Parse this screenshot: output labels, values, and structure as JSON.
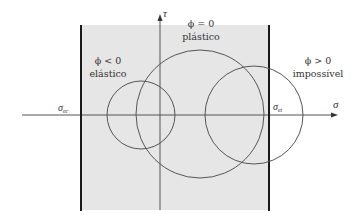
{
  "diagram": {
    "type": "mohr-circle-yield-regions",
    "colors": {
      "elastic_region_fill": "#e6e6e6",
      "line": "#555555",
      "boundary": "#1a1a1a",
      "text": "#333333"
    },
    "axes": {
      "x_label": "σ",
      "y_label": "τ"
    },
    "boundaries": {
      "left": {
        "symbol": "σ",
        "subscript": "ec"
      },
      "right": {
        "symbol": "σ",
        "subscript": "et"
      }
    },
    "regions": [
      {
        "id": "elastic",
        "condition": "ϕ < 0",
        "label": "elástico"
      },
      {
        "id": "plastic",
        "condition": "ϕ = 0",
        "label": "plástico"
      },
      {
        "id": "impossible",
        "condition": "ϕ > 0",
        "label": "impossível"
      }
    ],
    "circles": [
      {
        "id": "elastic-circle",
        "cx": 141,
        "cy": 115,
        "r": 34
      },
      {
        "id": "plastic-circle",
        "cx": 200,
        "cy": 114,
        "r": 64
      },
      {
        "id": "impossible-circle",
        "cx": 254,
        "cy": 115,
        "r": 49
      }
    ]
  }
}
